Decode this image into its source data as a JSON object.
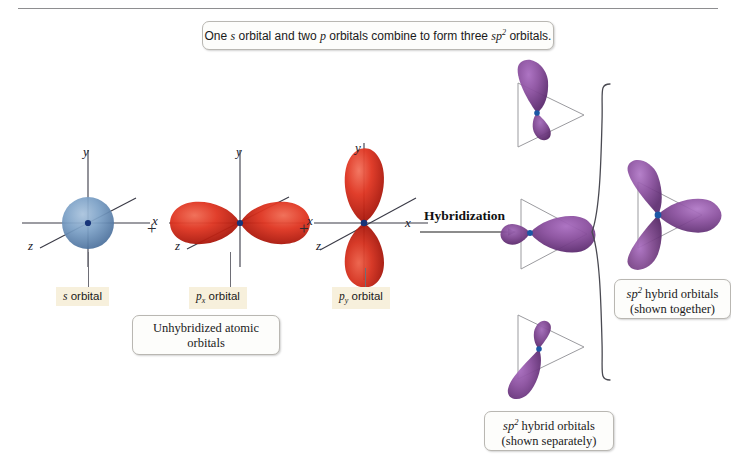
{
  "figure": {
    "banner": {
      "prefix": "One ",
      "s_italic": "s",
      "mid1": " orbital and two ",
      "p_italic": "p",
      "mid2": " orbitals combine to form three ",
      "sp_italic": "sp",
      "sp_exp": "2",
      "suffix": " orbitals."
    },
    "process_label": "Hybridization",
    "plus_sign": "+"
  },
  "axes": {
    "x": "x",
    "y": "y",
    "z": "z"
  },
  "orbitals": {
    "s": {
      "label_prefix": "s",
      "label_suffix": " orbital",
      "color": "#5b83b0"
    },
    "px": {
      "label_prefix": "p",
      "label_sub": "x",
      "label_suffix": " orbital",
      "color": "#d32a1c"
    },
    "py": {
      "label_prefix": "p",
      "label_sub": "y",
      "label_suffix": " orbital",
      "color": "#d32a1c"
    },
    "hybrid": {
      "color": "#8a4f9e",
      "node_color": "#1b57a5"
    }
  },
  "captions": {
    "unhybridized": {
      "line1": "Unhybridized atomic",
      "line2": "orbitals"
    },
    "together": {
      "sp": "sp",
      "exp": "2",
      "line1_rest": " hybrid orbitals",
      "line2": "(shown together)"
    },
    "separately": {
      "sp": "sp",
      "exp": "2",
      "line1_rest": " hybrid orbitals",
      "line2": "(shown separately)"
    }
  }
}
